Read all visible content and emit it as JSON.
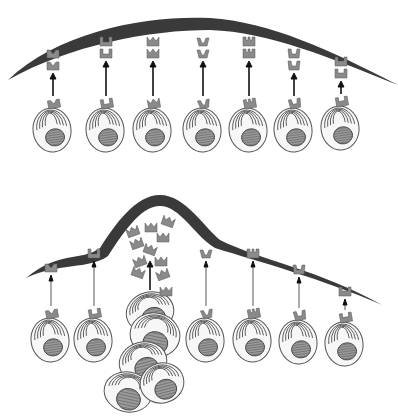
{
  "figure": {
    "colors": {
      "tissue": "#3a3a3a",
      "receptor": "#8a8a8a",
      "nucleus": "#9a9a9a",
      "cell": "#f7f7f7",
      "outline": "#555555"
    }
  },
  "panels": [
    {
      "id": "top",
      "tissue_path": "M8,80 C60,30 150,15 210,18 C270,22 330,50 398,85 C330,58 270,32 210,30 C150,30 70,45 8,80 Z",
      "cells": [
        {
          "cx": 52,
          "cy": 130,
          "receptor": "M",
          "arrow": "thick",
          "arrow_len": 22
        },
        {
          "cx": 105,
          "cy": 130,
          "receptor": "U",
          "arrow": "thick",
          "arrow_len": 34
        },
        {
          "cx": 152,
          "cy": 130,
          "receptor": "crown",
          "arrow": "thick",
          "arrow_len": 34
        },
        {
          "cx": 202,
          "cy": 130,
          "receptor": "V",
          "arrow": "thick",
          "arrow_len": 34
        },
        {
          "cx": 248,
          "cy": 130,
          "receptor": "E",
          "arrow": "thick",
          "arrow_len": 34
        },
        {
          "cx": 293,
          "cy": 130,
          "receptor": "W",
          "arrow": "thick",
          "arrow_len": 22
        },
        {
          "cx": 340,
          "cy": 128,
          "receptor": "H",
          "arrow": "thick",
          "arrow_len": 12
        }
      ]
    },
    {
      "id": "bottom",
      "tissue_path": "M26,278 C60,250 80,262 100,248 C115,225 135,195 160,195 C185,195 205,228 220,240 C260,260 320,270 382,305 C320,278 260,262 215,248 C195,236 180,206 160,206 C140,206 122,235 108,256 C88,270 60,262 26,278 Z",
      "cells": [
        {
          "cx": 50,
          "cy": 340,
          "receptor": "M",
          "arrow": "thin",
          "arrow_len": 30
        },
        {
          "cx": 93,
          "cy": 340,
          "receptor": "U",
          "arrow": "thin",
          "arrow_len": 44
        },
        {
          "cx": 205,
          "cy": 340,
          "receptor": "V",
          "arrow": "thin",
          "arrow_len": 44
        },
        {
          "cx": 252,
          "cy": 340,
          "receptor": "E",
          "arrow": "thin",
          "arrow_len": 44
        },
        {
          "cx": 298,
          "cy": 342,
          "receptor": "W",
          "arrow": "thin",
          "arrow_len": 30
        },
        {
          "cx": 344,
          "cy": 344,
          "receptor": "H",
          "arrow": "thin",
          "arrow_len": 10
        }
      ],
      "clone": {
        "receptor": "crown",
        "arrow": {
          "x": 150,
          "y1": 290,
          "y2": 262
        },
        "cells": [
          {
            "cx": 150,
            "cy": 312,
            "rx": 24,
            "ry": 20
          },
          {
            "cx": 155,
            "cy": 335,
            "rx": 25,
            "ry": 22
          },
          {
            "cx": 143,
            "cy": 362,
            "rx": 24,
            "ry": 20
          },
          {
            "cx": 128,
            "cy": 392,
            "rx": 24,
            "ry": 20
          },
          {
            "cx": 162,
            "cy": 383,
            "rx": 22,
            "ry": 20
          }
        ],
        "secreted": [
          {
            "x": 133,
            "y": 232
          },
          {
            "x": 151,
            "y": 228
          },
          {
            "x": 168,
            "y": 222
          },
          {
            "x": 137,
            "y": 244
          },
          {
            "x": 163,
            "y": 238
          },
          {
            "x": 150,
            "y": 250
          },
          {
            "x": 140,
            "y": 262
          },
          {
            "x": 161,
            "y": 262
          },
          {
            "x": 138,
            "y": 273
          },
          {
            "x": 163,
            "y": 275
          },
          {
            "x": 166,
            "y": 292
          }
        ]
      }
    }
  ]
}
